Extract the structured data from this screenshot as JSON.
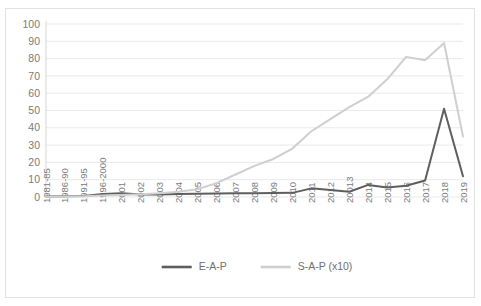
{
  "chart_data": {
    "type": "line",
    "title": "",
    "xlabel": "",
    "ylabel": "",
    "ylim": [
      0,
      100
    ],
    "ytick_step": 10,
    "yticks": [
      "0",
      "10",
      "20",
      "30",
      "40",
      "50",
      "60",
      "70",
      "80",
      "90",
      "100"
    ],
    "grid": true,
    "legend_position": "bottom",
    "categories": [
      "1981-85",
      "1986-90",
      "1991-95",
      "1996-2000",
      "2001",
      "2002",
      "2003",
      "2004",
      "2005",
      "2006",
      "2007",
      "2008",
      "2009",
      "2010",
      "2011",
      "2012",
      "20013",
      "2014",
      "2015",
      "2016",
      "2017",
      "2018",
      "2019"
    ],
    "series": [
      {
        "name": "E-A-P",
        "color": "#5e5e5e",
        "width": 2.0,
        "values": [
          0.3,
          0.5,
          0.6,
          1.8,
          2.2,
          1.4,
          1.5,
          1.8,
          1.9,
          2.0,
          2.1,
          2.2,
          2.3,
          2.4,
          5.0,
          4.0,
          3.0,
          7.0,
          5.5,
          6.5,
          9.5,
          51.0,
          12.0
        ]
      },
      {
        "name": "S-A-P (x10)",
        "color": "#cfcfcf",
        "width": 2.0,
        "values": [
          0.2,
          0.3,
          0.4,
          0.8,
          1.2,
          1.6,
          2.2,
          3.0,
          4.5,
          8.0,
          13.0,
          18.0,
          22.0,
          28.0,
          38.0,
          45.0,
          52.0,
          58.0,
          68.0,
          81.0,
          79.0,
          89.0,
          35.0
        ]
      }
    ]
  },
  "legend": {
    "entries": [
      {
        "label": "E-A-P"
      },
      {
        "label": "S-A-P (x10)"
      }
    ]
  }
}
